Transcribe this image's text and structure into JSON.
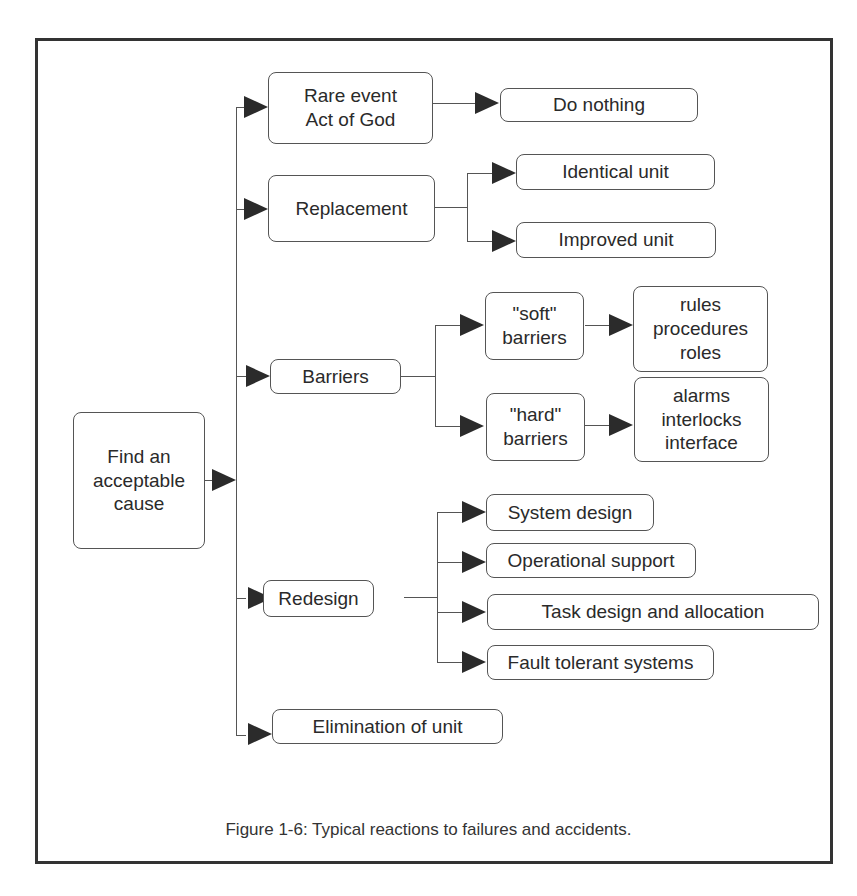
{
  "figure": {
    "caption": "Figure 1-6: Typical reactions to failures and accidents."
  },
  "diagram": {
    "type": "tree",
    "root": {
      "label": "Find an acceptable cause"
    },
    "nodes": {
      "root": "Find an\nacceptable\ncause",
      "rare_event": "Rare event\nAct of God",
      "do_nothing": "Do nothing",
      "replacement": "Replacement",
      "identical_unit": "Identical unit",
      "improved_unit": "Improved unit",
      "barriers": "Barriers",
      "soft_barriers": "\"soft\"\nbarriers",
      "soft_items": "rules\nprocedures\nroles",
      "hard_barriers": "\"hard\"\nbarriers",
      "hard_items": "alarms\ninterlocks\ninterface",
      "redesign": "Redesign",
      "system_design": "System design",
      "operational_support": "Operational support",
      "task_design": "Task design and allocation",
      "fault_tolerant": "Fault tolerant systems",
      "elimination": "Elimination of unit"
    },
    "edges": [
      [
        "root",
        "rare_event"
      ],
      [
        "root",
        "replacement"
      ],
      [
        "root",
        "barriers"
      ],
      [
        "root",
        "redesign"
      ],
      [
        "root",
        "elimination"
      ],
      [
        "rare_event",
        "do_nothing"
      ],
      [
        "replacement",
        "identical_unit"
      ],
      [
        "replacement",
        "improved_unit"
      ],
      [
        "barriers",
        "soft_barriers"
      ],
      [
        "barriers",
        "hard_barriers"
      ],
      [
        "soft_barriers",
        "soft_items"
      ],
      [
        "hard_barriers",
        "hard_items"
      ],
      [
        "redesign",
        "system_design"
      ],
      [
        "redesign",
        "operational_support"
      ],
      [
        "redesign",
        "task_design"
      ],
      [
        "redesign",
        "fault_tolerant"
      ]
    ]
  }
}
